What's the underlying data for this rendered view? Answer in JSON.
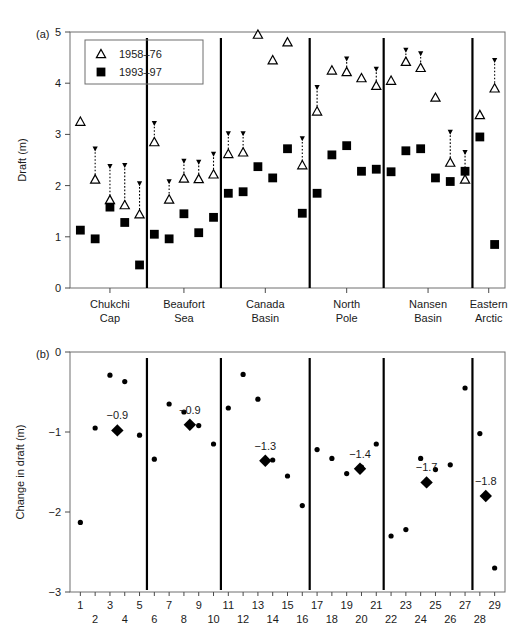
{
  "figure": {
    "panel_a_label": "(a)",
    "panel_b_label": "(b)"
  },
  "chart_data": [
    {
      "type": "scatter",
      "id": "panel-a",
      "title": "",
      "ylabel": "Draft (m)",
      "xlabel": "",
      "ylim": [
        0,
        5
      ],
      "xlim": [
        0.3,
        29.7
      ],
      "yticks": [
        "0",
        "1",
        "2",
        "3",
        "4",
        "5"
      ],
      "ytick_values": [
        0,
        1,
        2,
        3,
        4,
        5
      ],
      "grid": false,
      "legend_position": "top-left",
      "legend": [
        {
          "marker": "open-triangle",
          "label": "1958–76"
        },
        {
          "marker": "filled-square",
          "label": "1993–97"
        }
      ],
      "region_dividers_x": [
        5.5,
        10.5,
        16.5,
        21.5,
        27.5
      ],
      "regions": [
        {
          "label_line1": "Chukchi",
          "label_line2": "Cap",
          "center_x": 3.0
        },
        {
          "label_line1": "Beaufort",
          "label_line2": "Sea",
          "center_x": 8.0
        },
        {
          "label_line1": "Canada",
          "label_line2": "Basin",
          "center_x": 13.5
        },
        {
          "label_line1": "North",
          "label_line2": "Pole",
          "center_x": 19.0
        },
        {
          "label_line1": "Nansen",
          "label_line2": "Basin",
          "center_x": 24.5
        },
        {
          "label_line1": "Eastern",
          "label_line2": "Arctic",
          "center_x": 28.6
        }
      ],
      "series": [
        {
          "name": "1958–76",
          "marker": "open-triangle",
          "x": [
            1,
            2,
            3,
            4,
            5,
            6,
            7,
            8,
            9,
            10,
            11,
            12,
            13,
            14,
            15,
            16,
            17,
            18,
            19,
            20,
            21,
            22,
            23,
            24,
            25,
            26,
            27,
            28,
            29
          ],
          "values": [
            3.25,
            2.12,
            1.72,
            1.62,
            1.44,
            2.85,
            1.73,
            2.14,
            2.13,
            2.22,
            2.62,
            2.65,
            4.95,
            4.45,
            4.8,
            2.4,
            3.45,
            4.25,
            4.22,
            4.1,
            3.95,
            4.05,
            4.42,
            4.3,
            3.72,
            2.45,
            2.12,
            3.38,
            3.9
          ]
        },
        {
          "name": "1993–97",
          "marker": "filled-square",
          "x": [
            1,
            2,
            3,
            4,
            5,
            6,
            7,
            8,
            9,
            10,
            11,
            12,
            13,
            14,
            15,
            16,
            17,
            18,
            19,
            20,
            21,
            22,
            23,
            24,
            25,
            26,
            27,
            28,
            29
          ],
          "values": [
            1.13,
            0.96,
            1.58,
            1.28,
            0.45,
            1.05,
            0.96,
            1.45,
            1.08,
            1.38,
            1.85,
            1.88,
            2.37,
            2.15,
            2.72,
            1.46,
            1.85,
            2.6,
            2.78,
            2.28,
            2.32,
            2.27,
            2.68,
            2.72,
            2.15,
            2.08,
            2.28,
            2.95,
            0.85
          ]
        }
      ],
      "whiskers": [
        {
          "x": 2,
          "top": 2.72
        },
        {
          "x": 3,
          "top": 2.38
        },
        {
          "x": 4,
          "top": 2.4
        },
        {
          "x": 5,
          "top": 2.04
        },
        {
          "x": 6,
          "top": 3.22
        },
        {
          "x": 7,
          "top": 2.08
        },
        {
          "x": 8,
          "top": 2.48
        },
        {
          "x": 9,
          "top": 2.46
        },
        {
          "x": 10,
          "top": 2.62
        },
        {
          "x": 11,
          "top": 3.02
        },
        {
          "x": 12,
          "top": 3.02
        },
        {
          "x": 16,
          "top": 2.92
        },
        {
          "x": 17,
          "top": 3.92
        },
        {
          "x": 19,
          "top": 4.48
        },
        {
          "x": 21,
          "top": 4.28
        },
        {
          "x": 23,
          "top": 4.65
        },
        {
          "x": 24,
          "top": 4.58
        },
        {
          "x": 26,
          "top": 3.05
        },
        {
          "x": 27,
          "top": 2.65
        },
        {
          "x": 29,
          "top": 4.45
        }
      ]
    },
    {
      "type": "scatter",
      "id": "panel-b",
      "title": "",
      "ylabel": "Change in draft (m)",
      "xlabel": "",
      "ylim": [
        -3,
        0
      ],
      "xlim": [
        0.3,
        29.7
      ],
      "yticks": [
        "0",
        "−1",
        "−2",
        "−3"
      ],
      "ytick_values": [
        0,
        -1,
        -2,
        -3
      ],
      "grid": false,
      "xticks": [
        "1",
        "2",
        "3",
        "4",
        "5",
        "6",
        "7",
        "8",
        "9",
        "10",
        "11",
        "12",
        "13",
        "14",
        "15",
        "16",
        "17",
        "18",
        "19",
        "20",
        "21",
        "22",
        "23",
        "24",
        "25",
        "26",
        "27",
        "28",
        "29"
      ],
      "region_dividers_x": [
        5.5,
        10.5,
        16.5,
        21.5,
        27.5
      ],
      "series": [
        {
          "name": "Change in draft",
          "marker": "small-dot",
          "x": [
            1,
            2,
            3,
            4,
            5,
            6,
            7,
            8,
            9,
            10,
            11,
            12,
            13,
            14,
            15,
            16,
            17,
            18,
            19,
            20,
            21,
            22,
            23,
            24,
            25,
            26,
            27,
            28,
            29
          ],
          "values": [
            -2.13,
            -0.95,
            -0.29,
            -0.37,
            -1.04,
            -1.34,
            -0.65,
            -0.75,
            -0.92,
            -1.15,
            -0.7,
            -0.28,
            -0.59,
            -1.35,
            -1.55,
            -1.92,
            -1.22,
            -1.33,
            -1.52,
            -1.44,
            -1.15,
            -2.3,
            -2.22,
            -1.33,
            -1.47,
            -1.41,
            -0.45,
            -1.02,
            -2.7
          ]
        }
      ],
      "region_means": [
        {
          "label": "−0.9",
          "x": 3.5,
          "value": -0.98
        },
        {
          "label": "−0.9",
          "x": 8.4,
          "value": -0.91
        },
        {
          "label": "−1.3",
          "x": 13.5,
          "value": -1.36
        },
        {
          "label": "−1.4",
          "x": 19.9,
          "value": -1.46
        },
        {
          "label": "−1.7",
          "x": 24.4,
          "value": -1.63
        },
        {
          "label": "−1.8",
          "x": 28.4,
          "value": -1.8
        }
      ]
    }
  ]
}
